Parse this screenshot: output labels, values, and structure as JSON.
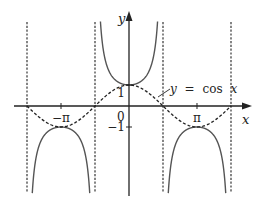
{
  "chart_data": {
    "type": "line",
    "title": "",
    "xlabel": "x",
    "ylabel": "y",
    "xlim": [
      -5.5,
      5.5
    ],
    "ylim": [
      -4.5,
      4.5
    ],
    "grid": false,
    "x_ticks": [
      {
        "value": -3.14159,
        "label": "−π"
      },
      {
        "value": 3.14159,
        "label": "π"
      }
    ],
    "y_ticks": [
      {
        "value": 1,
        "label": "1"
      },
      {
        "value": -1,
        "label": "−1"
      }
    ],
    "origin_label": "0",
    "asymptotes": [
      -4.71239,
      -1.5708,
      1.5708,
      4.71239
    ],
    "series": [
      {
        "name": "y = sec x",
        "function": "sec",
        "style": "solid",
        "color": "#555555"
      },
      {
        "name": "y = cos x",
        "function": "cos",
        "style": "dashed",
        "color": "#222222"
      }
    ],
    "annotations": [
      {
        "text": "y = cos x",
        "points_to": "cos curve",
        "near_x": 1.4
      }
    ]
  },
  "labels": {
    "x_axis": "x",
    "y_axis": "y",
    "cos_label_y": "y",
    "cos_label_eq": "=",
    "cos_label_fn": "cos",
    "cos_label_x": "x"
  }
}
